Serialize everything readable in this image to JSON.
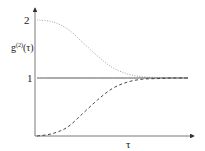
{
  "chart_data": {
    "type": "line",
    "title": "",
    "xlabel": "τ",
    "ylabel": "g(2)(τ)",
    "ylabel_base": "g",
    "ylabel_sup": "(2)",
    "ylabel_arg": "(τ)",
    "y_ticks": [
      "2",
      "1"
    ],
    "ylim": [
      0,
      2.2
    ],
    "grid": false,
    "legend": null,
    "x": [
      0,
      0.1,
      0.2,
      0.3,
      0.4,
      0.5,
      0.6,
      0.7,
      0.8,
      0.9,
      1.0
    ],
    "series": [
      {
        "name": "bunched (dotted)",
        "style": "dotted",
        "values": [
          2.0,
          1.97,
          1.85,
          1.62,
          1.38,
          1.18,
          1.07,
          1.02,
          1.01,
          1.0,
          1.0
        ]
      },
      {
        "name": "coherent (solid)",
        "style": "solid",
        "values": [
          1,
          1,
          1,
          1,
          1,
          1,
          1,
          1,
          1,
          1,
          1
        ]
      },
      {
        "name": "antibunched (dashed)",
        "style": "dashed",
        "values": [
          0.0,
          0.04,
          0.15,
          0.38,
          0.62,
          0.82,
          0.93,
          0.98,
          0.99,
          1.0,
          1.0
        ]
      }
    ]
  }
}
